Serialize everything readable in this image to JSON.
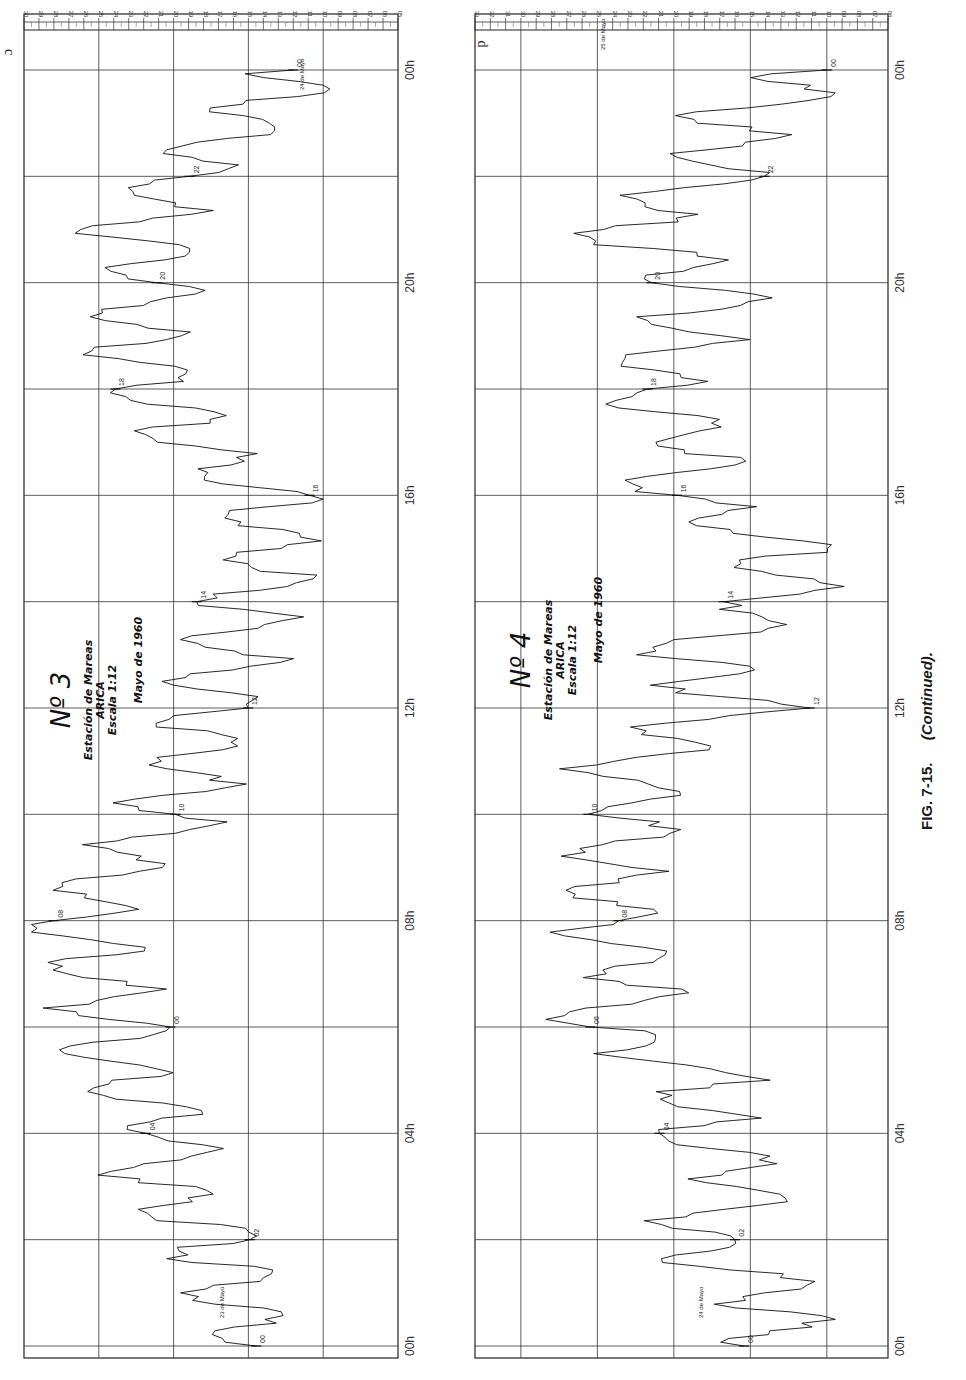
{
  "figure": {
    "caption_label": "FIG. 7-15.",
    "caption_note": "(Continued)."
  },
  "panels": [
    {
      "letter": "c",
      "number_label": "Nº 3",
      "station": "Estación de Mareas",
      "place": "ARICA",
      "scale": "Escala 1:12",
      "date": "Mayo de 1960",
      "start_date_note": "23 de Mayo",
      "end_date_note": "24 de Mayo",
      "scale_ticks": [
        "30",
        "29",
        "28",
        "27",
        "26",
        "25",
        "24",
        "23",
        "22",
        "21",
        "20",
        "19",
        "18",
        "17",
        "16",
        "15",
        "14",
        "13",
        "12",
        "11",
        "10",
        "09",
        "08",
        "07",
        "06",
        "05"
      ],
      "hour_axis": [
        "00h",
        "04h",
        "08h",
        "12h",
        "16h",
        "20h",
        "00h"
      ],
      "trace_marks": [
        "00",
        "02",
        "04",
        "06",
        "08",
        "10",
        "12",
        "14",
        "16",
        "18",
        "20",
        "22",
        "00"
      ]
    },
    {
      "letter": "d",
      "number_label": "Nº 4",
      "station": "Estación de Mareas",
      "place": "ARICA",
      "scale": "Escala 1:12",
      "date": "Mayo de 1960",
      "start_date_note": "24 de Mayo",
      "end_date_note": "25 de Mayo",
      "scale_ticks": [
        "33",
        "32",
        "31",
        "30",
        "29",
        "28",
        "27",
        "26",
        "25",
        "24",
        "23",
        "22",
        "21",
        "20",
        "19",
        "18",
        "17",
        "16",
        "15",
        "14",
        "13",
        "12",
        "11",
        "10",
        "09",
        "08",
        "07",
        "06"
      ],
      "hour_axis": [
        "00h",
        "04h",
        "08h",
        "12h",
        "16h",
        "20h",
        "00h"
      ],
      "trace_marks": [
        "00",
        "02",
        "04",
        "06",
        "08",
        "10",
        "12",
        "14",
        "16",
        "18",
        "20",
        "22",
        "00"
      ]
    }
  ],
  "chart_data": [
    {
      "type": "line",
      "title": "Nº 3 — Estación de Mareas ARICA, Escala 1:12, Mayo de 1960 (23–24 de Mayo)",
      "xlabel": "Hora",
      "ylabel": "Nivel (escala del mareógrafo)",
      "x": [
        "00h",
        "01h",
        "02h",
        "03h",
        "04h",
        "05h",
        "06h",
        "07h",
        "08h",
        "09h",
        "10h",
        "11h",
        "12h",
        "13h",
        "14h",
        "15h",
        "16h",
        "17h",
        "18h",
        "19h",
        "20h",
        "21h",
        "22h",
        "23h",
        "24h"
      ],
      "series": [
        {
          "name": "Marigrama Nº 3",
          "values": [
            14.5,
            16.5,
            17.0,
            21.5,
            20.0,
            23.5,
            24.0,
            25.0,
            27.0,
            24.5,
            20.0,
            19.0,
            17.0,
            16.0,
            15.0,
            13.5,
            14.0,
            19.5,
            21.0,
            23.0,
            21.0,
            22.5,
            20.0,
            15.5,
            12.0
          ]
        }
      ],
      "ylim": [
        5,
        30
      ],
      "xlim": [
        "00h",
        "00h (+24h)"
      ],
      "grid": true,
      "orientation": "rotated 90° (time runs bottom→top, scale decreases left→right)"
    },
    {
      "type": "line",
      "title": "Nº 4 — Estación de Mareas ARICA, Escala 1:12, Mayo de 1960 (24–25 de Mayo)",
      "xlabel": "Hora",
      "ylabel": "Nivel (escala del mareógrafo)",
      "x": [
        "00h",
        "01h",
        "02h",
        "03h",
        "04h",
        "05h",
        "06h",
        "07h",
        "08h",
        "09h",
        "10h",
        "11h",
        "12h",
        "13h",
        "14h",
        "15h",
        "16h",
        "17h",
        "18h",
        "19h",
        "20h",
        "21h",
        "22h",
        "23h",
        "24h"
      ],
      "series": [
        {
          "name": "Marigrama Nº 4",
          "values": [
            14.0,
            13.0,
            20.0,
            14.0,
            19.0,
            17.5,
            25.0,
            22.0,
            24.5,
            24.0,
            22.5,
            24.0,
            15.5,
            20.0,
            13.0,
            12.5,
            20.5,
            18.0,
            22.0,
            19.0,
            17.5,
            24.5,
            17.0,
            16.5,
            10.0
          ]
        }
      ],
      "ylim": [
        6,
        33
      ],
      "xlim": [
        "00h",
        "00h (+24h)"
      ],
      "grid": true,
      "orientation": "rotated 90° (time runs bottom→top, scale decreases left→right)"
    }
  ]
}
